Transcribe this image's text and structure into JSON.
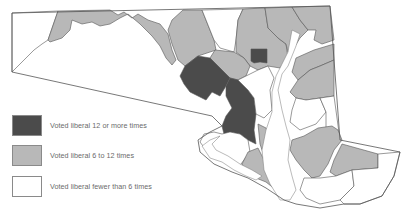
{
  "map": {
    "region": "Maryland",
    "colors": {
      "high": "#4b4b4b",
      "mid": "#b8b8b8",
      "low": "#ffffff",
      "outline": "#555555"
    }
  },
  "legend": {
    "items": [
      {
        "label": "Voted liberal 12 or more times",
        "class": "high",
        "color": "#4b4b4b"
      },
      {
        "label": "Voted liberal 6 to 12 times",
        "class": "mid",
        "color": "#b8b8b8"
      },
      {
        "label": "Voted liberal fewer than 6 times",
        "class": "low",
        "color": "#ffffff"
      }
    ]
  }
}
